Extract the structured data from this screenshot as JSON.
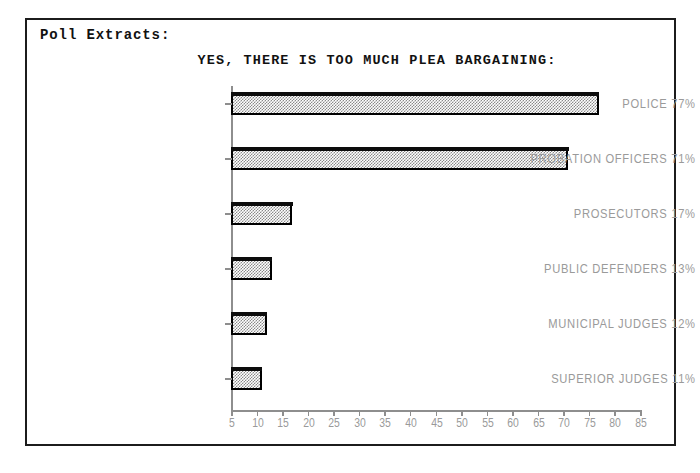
{
  "window": {
    "header_label": "Poll Extracts:"
  },
  "chart_data": {
    "type": "bar",
    "orientation": "horizontal",
    "title": "YES, THERE IS TOO MUCH PLEA BARGAINING:",
    "xlabel": "",
    "ylabel": "",
    "categories": [
      "POLICE",
      "PROBATION OFFICERS",
      "PROSECUTORS",
      "PUBLIC DEFENDERS",
      "MUNICIPAL JUDGES",
      "SUPERIOR JUDGES"
    ],
    "values": [
      77,
      71,
      17,
      13,
      12,
      11
    ],
    "value_unit": "%",
    "category_labels": [
      "POLICE 77%",
      "PROBATION OFFICERS 71%",
      "PROSECUTORS 17%",
      "PUBLIC DEFENDERS 13%",
      "MUNICIPAL JUDGES 12%",
      "SUPERIOR JUDGES 11%"
    ],
    "xlim": [
      5,
      85
    ],
    "xticks": [
      5,
      10,
      15,
      20,
      25,
      30,
      35,
      40,
      45,
      50,
      55,
      60,
      65,
      70,
      75,
      80,
      85
    ],
    "xtick_labels": [
      "5",
      "10",
      "15",
      "20",
      "25",
      "30",
      "35",
      "40",
      "45",
      "50",
      "55",
      "60",
      "65",
      "70",
      "75",
      "80",
      "85"
    ],
    "grid": false,
    "legend": null,
    "bar_fill": "#8a8a8a",
    "bar_edge": "#000000",
    "axis_color": "#8e8e8e",
    "label_color": "#9a9a9a",
    "title_color": "#111111"
  }
}
